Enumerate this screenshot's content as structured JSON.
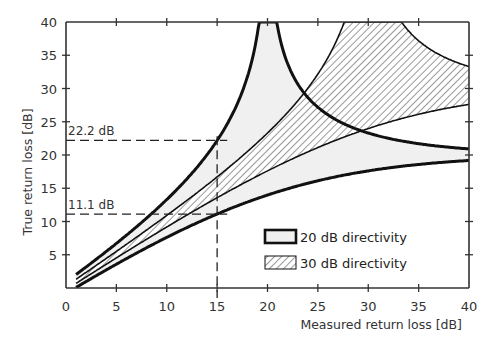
{
  "chart_data": {
    "type": "area",
    "title": "",
    "xlabel": "Measured return loss [dB]",
    "ylabel": "True return loss [dB]",
    "xlim": [
      0,
      40
    ],
    "ylim": [
      0,
      40
    ],
    "xticks": [
      0,
      5,
      10,
      15,
      20,
      25,
      30,
      35,
      40
    ],
    "yticks": [
      5,
      10,
      15,
      20,
      25,
      30,
      35,
      40
    ],
    "x_tick_labels": [
      "0",
      "5",
      "10",
      "15",
      "20",
      "25",
      "30",
      "35",
      "40"
    ],
    "y_tick_labels": [
      "5",
      "10",
      "15",
      "20",
      "25",
      "30",
      "35",
      "40"
    ],
    "grid": false,
    "legend_position": "lower right",
    "series": [
      {
        "name": "20 dB directivity",
        "directivity_db": 20,
        "style": "light gray fill, thick black outline",
        "x": [
          1,
          5,
          10,
          15,
          19,
          20,
          21,
          25,
          30,
          35,
          40
        ],
        "upper": [
          2.0,
          6.6,
          13.3,
          22.2,
          34.9,
          40,
          40,
          29.4,
          23.5,
          21.6,
          20.9
        ],
        "lower": [
          0.2,
          3.9,
          8.1,
          11.1,
          13.3,
          13.6,
          14.0,
          15.9,
          17.6,
          18.8,
          19.4
        ]
      },
      {
        "name": "30 dB directivity",
        "directivity_db": 30,
        "style": "diagonal hatch fill, thin black outline",
        "x": [
          1,
          5,
          10,
          15,
          20,
          25,
          28,
          30,
          33,
          35,
          40
        ],
        "upper": [
          1.1,
          5.3,
          10.9,
          16.7,
          23.3,
          31.9,
          40,
          40,
          40,
          36.1,
          33.3
        ],
        "lower": [
          0.9,
          4.7,
          9.4,
          13.7,
          17.6,
          21.2,
          22.4,
          23.1,
          24.2,
          25.0,
          27.2
        ]
      }
    ],
    "annotations": [
      {
        "text": "22.2 dB",
        "x": 15,
        "y": 22.2,
        "style": "dashed horizontal guide"
      },
      {
        "text": "11.1 dB",
        "x": 15,
        "y": 11.1,
        "style": "dashed horizontal guide"
      },
      {
        "text": "",
        "x": 15,
        "style": "dashed vertical guide"
      }
    ]
  },
  "labels": {
    "xlabel": "Measured return loss [dB]",
    "ylabel": "True return loss [dB]",
    "annot_upper": "22.2 dB",
    "annot_lower": "11.1 dB",
    "legend_20": "20 dB directivity",
    "legend_30": "30 dB directivity"
  },
  "colors": {
    "fill_20": "#f0f0f0",
    "line": "#111111",
    "axis": "#333333",
    "hatch": "#444444"
  }
}
